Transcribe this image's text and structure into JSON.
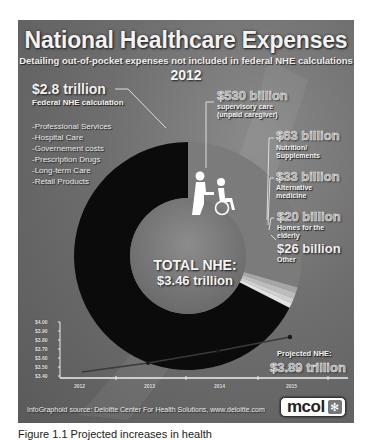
{
  "header": {
    "title": "National Healthcare Expenses",
    "subtitle": "Detailing out-of-pocket expenses not included in federal NHE calculations",
    "year": "2012"
  },
  "federal": {
    "amount": "$2.8 trillion",
    "label": "Federal NHE calculation",
    "items": [
      "-Professional Services",
      "-Hospital Care",
      "-Governement costs",
      "-Prescription Drugs",
      "-Long-term Care",
      "-Retail Products"
    ]
  },
  "segments": [
    {
      "amount": "$530 billion",
      "label_lines": [
        "supervisory care",
        "(unpaid caregiver)"
      ]
    },
    {
      "amount": "$63 billion",
      "label_lines": [
        "Nutrition/",
        "Supplements"
      ]
    },
    {
      "amount": "$33 billion",
      "label_lines": [
        "Alternative",
        "medicine"
      ]
    },
    {
      "amount": "$20 billion",
      "label_lines": [
        "Homes for the",
        "elderly"
      ]
    },
    {
      "amount": "$26 billion",
      "label_lines": [
        "Other"
      ]
    }
  ],
  "center": {
    "line1": "TOTAL NHE:",
    "line2": "$3.46 trillion"
  },
  "icon": "caregiver-wheelchair-icon",
  "projection": {
    "label": "Projected NHE:",
    "value": "$3.89 trillion"
  },
  "axis": {
    "y_ticks": [
      "$4.00",
      "$3.90",
      "$3.80",
      "$3.70",
      "$3.60",
      "$3.50",
      "$3.40"
    ],
    "x_ticks": [
      "2012",
      "2013",
      "2014",
      "2015"
    ]
  },
  "source": "InfoGraphoid source:  Deloitte Center For Health Solutions, www.deloitte.com",
  "logo": {
    "text": "mcol",
    "mark": "✻"
  },
  "caption": "Figure 1.1 Projected increases in health",
  "colors": {
    "federal": "#0a0a0a",
    "supervisory": "#7c7c7c",
    "panel": "#6a6a6a"
  },
  "chart_data": [
    {
      "type": "pie",
      "title": "National Healthcare Expenses 2012",
      "subtitle": "Detailing out-of-pocket expenses not included in federal NHE calculations",
      "categories": [
        "Federal NHE calculation",
        "Supervisory care (unpaid caregiver)",
        "Nutrition/Supplements",
        "Alternative medicine",
        "Homes for the elderly",
        "Other"
      ],
      "values": [
        2800,
        530,
        63,
        33,
        20,
        26
      ],
      "unit": "billion USD",
      "donut": true,
      "center_annotation": "TOTAL NHE: $3.46 trillion"
    },
    {
      "type": "line",
      "title": "Projected NHE",
      "x": [
        "2012",
        "2013",
        "2014",
        "2015"
      ],
      "series": [
        {
          "name": "Projected NHE (trillion $)",
          "values": [
            3.46,
            3.6,
            3.74,
            3.89
          ]
        }
      ],
      "ylim": [
        3.4,
        4.0
      ],
      "y_ticks": [
        3.4,
        3.5,
        3.6,
        3.7,
        3.8,
        3.9,
        4.0
      ],
      "annotation": "Projected NHE: $3.89 trillion"
    }
  ]
}
